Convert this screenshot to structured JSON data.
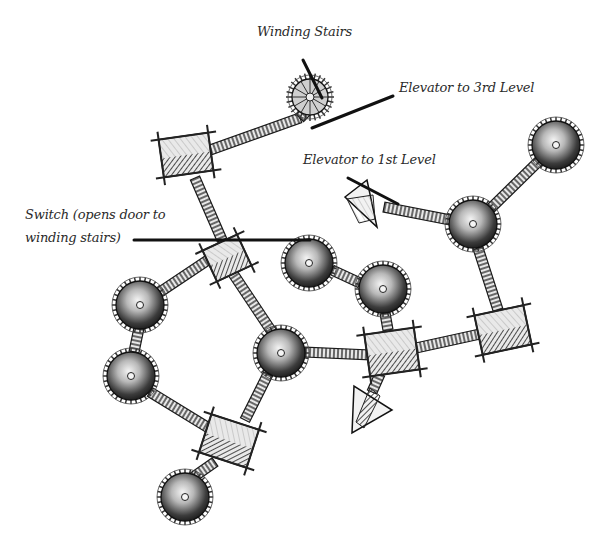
{
  "map": {
    "style": "hand-drawn pencil sketch, greyscale",
    "colors": {
      "ink": "#1a1a1a",
      "line": "#111111",
      "background": "#ffffff",
      "shade": "#3a3a3a",
      "light": "#d8d8d8"
    },
    "labels": [
      {
        "id": "winding-stairs",
        "text": "Winding Stairs",
        "x": 257,
        "y": 30,
        "leader": [
          [
            303,
            60
          ],
          [
            322,
            98
          ]
        ]
      },
      {
        "id": "elevator-3rd",
        "text": "Elevator to 3rd Level",
        "x": 399,
        "y": 77,
        "leader": [
          [
            393,
            96
          ],
          [
            312,
            128
          ]
        ]
      },
      {
        "id": "elevator-1st",
        "text": "Elevator to 1st Level",
        "x": 303,
        "y": 152,
        "leader": [
          [
            348,
            178
          ],
          [
            398,
            204
          ]
        ]
      },
      {
        "id": "switch",
        "text": "Switch (opens door to winding stairs)",
        "line1": "Switch (opens door to",
        "line2": "winding stairs)",
        "x": 26,
        "y": 207,
        "leader": [
          [
            134,
            240
          ],
          [
            310,
            240
          ]
        ]
      }
    ],
    "rooms": [
      {
        "id": "winding-stairs-tower",
        "type": "spiral",
        "cx": 310,
        "cy": 97,
        "r": 18
      },
      {
        "id": "tower-ne",
        "type": "round",
        "cx": 556,
        "cy": 145,
        "r": 24
      },
      {
        "id": "tower-east-hub",
        "type": "round",
        "cx": 473,
        "cy": 224,
        "r": 24
      },
      {
        "id": "tower-mid-a",
        "type": "round",
        "cx": 309,
        "cy": 263,
        "r": 24
      },
      {
        "id": "tower-mid-b",
        "type": "round",
        "cx": 383,
        "cy": 289,
        "r": 24
      },
      {
        "id": "tower-west-upper",
        "type": "round",
        "cx": 140,
        "cy": 305,
        "r": 24
      },
      {
        "id": "tower-west-lower",
        "type": "round",
        "cx": 131,
        "cy": 376,
        "r": 24
      },
      {
        "id": "tower-central",
        "type": "round",
        "cx": 281,
        "cy": 353,
        "r": 24
      },
      {
        "id": "tower-south",
        "type": "round",
        "cx": 185,
        "cy": 497,
        "r": 24
      },
      {
        "id": "hall-nw",
        "type": "rect",
        "cx": 186,
        "cy": 155,
        "w": 50,
        "h": 38,
        "rot": -8
      },
      {
        "id": "switch-room",
        "type": "rect",
        "cx": 227,
        "cy": 258,
        "w": 38,
        "h": 34,
        "rot": -25
      },
      {
        "id": "hall-center-east",
        "type": "rect",
        "cx": 392,
        "cy": 352,
        "w": 50,
        "h": 42,
        "rot": -8
      },
      {
        "id": "hall-east",
        "type": "rect",
        "cx": 503,
        "cy": 330,
        "w": 50,
        "h": 40,
        "rot": -12
      },
      {
        "id": "hall-south",
        "type": "rect",
        "cx": 229,
        "cy": 441,
        "w": 50,
        "h": 40,
        "rot": 18
      },
      {
        "id": "elevator-1st-level",
        "type": "triangle",
        "cx": 367,
        "cy": 205,
        "rot": 0
      },
      {
        "id": "elevator-south",
        "type": "triangle",
        "cx": 370,
        "cy": 408,
        "rot": 0
      }
    ],
    "corridors": [
      [
        [
          210,
          150
        ],
        [
          300,
          118
        ]
      ],
      [
        [
          300,
          118
        ],
        [
          310,
          108
        ]
      ],
      [
        [
          195,
          178
        ],
        [
          222,
          240
        ]
      ],
      [
        [
          232,
          272
        ],
        [
          272,
          332
        ]
      ],
      [
        [
          223,
          250
        ],
        [
          160,
          292
        ]
      ],
      [
        [
          139,
          328
        ],
        [
          134,
          352
        ]
      ],
      [
        [
          150,
          392
        ],
        [
          212,
          430
        ]
      ],
      [
        [
          268,
          374
        ],
        [
          245,
          420
        ]
      ],
      [
        [
          215,
          462
        ],
        [
          192,
          478
        ]
      ],
      [
        [
          305,
          352
        ],
        [
          370,
          355
        ]
      ],
      [
        [
          416,
          348
        ],
        [
          480,
          334
        ]
      ],
      [
        [
          478,
          248
        ],
        [
          498,
          310
        ]
      ],
      [
        [
          491,
          208
        ],
        [
          540,
          160
        ]
      ],
      [
        [
          384,
          207
        ],
        [
          450,
          220
        ]
      ],
      [
        [
          332,
          270
        ],
        [
          360,
          283
        ]
      ],
      [
        [
          385,
          313
        ],
        [
          388,
          330
        ]
      ],
      [
        [
          380,
          374
        ],
        [
          372,
          392
        ]
      ]
    ]
  }
}
